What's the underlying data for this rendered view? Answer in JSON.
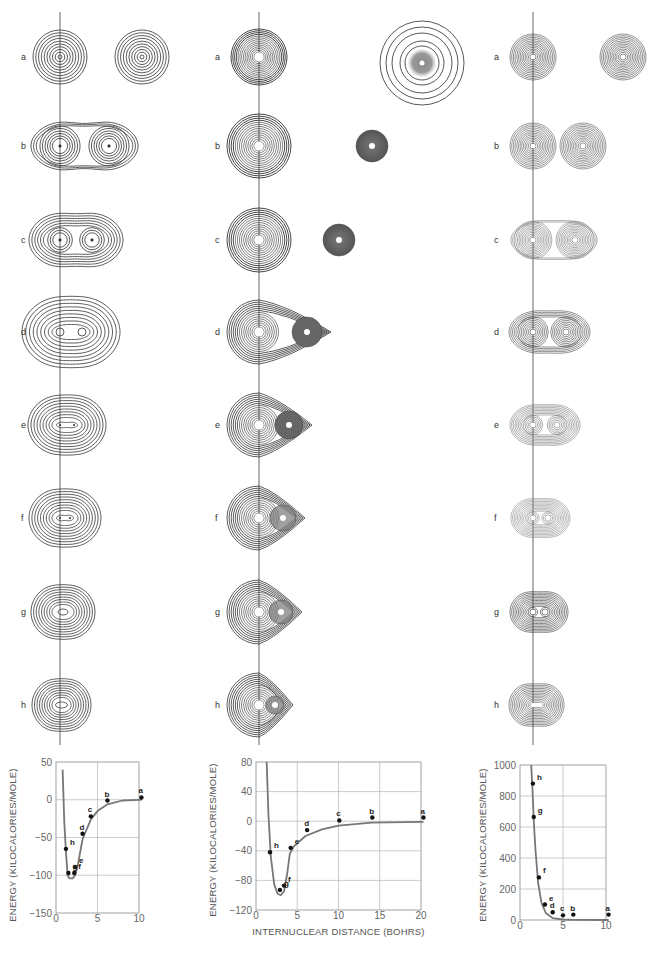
{
  "figure": {
    "row_labels": [
      "a",
      "b",
      "c",
      "d",
      "e",
      "f",
      "g",
      "h"
    ],
    "columns": [
      {
        "id": "left",
        "description": "symmetric diatomic contour maps, atoms approaching and merging"
      },
      {
        "id": "middle",
        "description": "large atom with small dense (shaded) atom approaching"
      },
      {
        "id": "right",
        "description": "two identical dense atoms approaching"
      }
    ]
  },
  "chart_data": [
    {
      "type": "line",
      "title": "",
      "xlabel": "",
      "ylabel": "ENERGY (KILOCALORIES/MOLE)",
      "xlim": [
        0,
        10
      ],
      "ylim": [
        -150,
        50
      ],
      "xticks": [
        "0",
        "5",
        "10"
      ],
      "yticks": [
        "50",
        "0",
        "-50",
        "-100",
        "-150"
      ],
      "grid": true,
      "series": [
        {
          "name": "computed (black points)",
          "points": [
            {
              "label": "a",
              "x": 10.3,
              "y": 3
            },
            {
              "label": "b",
              "x": 6.2,
              "y": -1
            },
            {
              "label": "c",
              "x": 4.2,
              "y": -22
            },
            {
              "label": "d",
              "x": 3.2,
              "y": -45
            },
            {
              "label": "e",
              "x": 2.3,
              "y": -89
            },
            {
              "label": "f",
              "x": 2.2,
              "y": -97
            },
            {
              "label": "g",
              "x": 1.5,
              "y": -97
            },
            {
              "label": "h",
              "x": 1.2,
              "y": -65
            }
          ]
        },
        {
          "name": "curve (gray)",
          "points": [
            {
              "x": 0.8,
              "y": 40
            },
            {
              "x": 1.0,
              "y": -30
            },
            {
              "x": 1.2,
              "y": -70
            },
            {
              "x": 1.4,
              "y": -100
            },
            {
              "x": 1.6,
              "y": -104
            },
            {
              "x": 2.0,
              "y": -104
            },
            {
              "x": 2.3,
              "y": -100
            },
            {
              "x": 2.6,
              "y": -88
            },
            {
              "x": 3.2,
              "y": -52
            },
            {
              "x": 4.2,
              "y": -26
            },
            {
              "x": 5.0,
              "y": -15
            },
            {
              "x": 6.2,
              "y": -6
            },
            {
              "x": 8.0,
              "y": -1
            },
            {
              "x": 10.0,
              "y": 0
            },
            {
              "x": 10.3,
              "y": 0
            }
          ]
        }
      ]
    },
    {
      "type": "line",
      "title": "",
      "xlabel": "INTERNUCLEAR DISTANCE (BOHRS)",
      "ylabel": "ENERGY (KILOCALORIES/MOLE)",
      "xlim": [
        0,
        20
      ],
      "ylim": [
        -120,
        80
      ],
      "xticks": [
        "0",
        "5",
        "10",
        "15",
        "20"
      ],
      "yticks": [
        "80",
        "40",
        "0",
        "-40",
        "-80",
        "-120"
      ],
      "grid": true,
      "series": [
        {
          "name": "computed (black points)",
          "points": [
            {
              "label": "a",
              "x": 20.3,
              "y": 5
            },
            {
              "label": "b",
              "x": 14.1,
              "y": 5
            },
            {
              "label": "c",
              "x": 10.1,
              "y": 1
            },
            {
              "label": "d",
              "x": 6.2,
              "y": -12
            },
            {
              "label": "e",
              "x": 4.2,
              "y": -36
            },
            {
              "label": "f",
              "x": 3.4,
              "y": -87
            },
            {
              "label": "g",
              "x": 2.9,
              "y": -93
            },
            {
              "label": "h",
              "x": 1.7,
              "y": -42
            }
          ]
        },
        {
          "name": "curve (gray)",
          "points": [
            {
              "x": 1.3,
              "y": 80
            },
            {
              "x": 1.5,
              "y": 10
            },
            {
              "x": 1.8,
              "y": -48
            },
            {
              "x": 2.2,
              "y": -85
            },
            {
              "x": 2.6,
              "y": -98
            },
            {
              "x": 3.0,
              "y": -100
            },
            {
              "x": 3.4,
              "y": -95
            },
            {
              "x": 3.8,
              "y": -70
            },
            {
              "x": 4.1,
              "y": -44
            },
            {
              "x": 4.6,
              "y": -34
            },
            {
              "x": 6.0,
              "y": -20
            },
            {
              "x": 8.0,
              "y": -11
            },
            {
              "x": 10.0,
              "y": -6
            },
            {
              "x": 14.0,
              "y": -2
            },
            {
              "x": 20.3,
              "y": -1
            }
          ]
        }
      ]
    },
    {
      "type": "line",
      "title": "",
      "xlabel": "",
      "ylabel": "ENERGY (KILOCALORIES/MOLE)",
      "xlim": [
        0,
        10
      ],
      "ylim": [
        0,
        1000
      ],
      "xticks": [
        "0",
        "5",
        "10"
      ],
      "yticks": [
        "1000",
        "800",
        "600",
        "400",
        "200",
        "0"
      ],
      "grid": true,
      "series": [
        {
          "name": "computed (black points)",
          "points": [
            {
              "label": "a",
              "x": 10.3,
              "y": 35
            },
            {
              "label": "b",
              "x": 6.2,
              "y": 35
            },
            {
              "label": "c",
              "x": 5.0,
              "y": 30
            },
            {
              "label": "d",
              "x": 3.8,
              "y": 50
            },
            {
              "label": "e",
              "x": 2.9,
              "y": 100
            },
            {
              "label": "f",
              "x": 2.2,
              "y": 275
            },
            {
              "label": "g",
              "x": 1.6,
              "y": 665
            },
            {
              "label": "h",
              "x": 1.5,
              "y": 880
            }
          ]
        },
        {
          "name": "curve (gray)",
          "points": [
            {
              "x": 1.3,
              "y": 1000
            },
            {
              "x": 1.45,
              "y": 840
            },
            {
              "x": 1.6,
              "y": 635
            },
            {
              "x": 1.8,
              "y": 450
            },
            {
              "x": 2.1,
              "y": 240
            },
            {
              "x": 2.5,
              "y": 110
            },
            {
              "x": 3.0,
              "y": 45
            },
            {
              "x": 3.8,
              "y": 12
            },
            {
              "x": 5.0,
              "y": 3
            },
            {
              "x": 6.2,
              "y": 1
            },
            {
              "x": 10.3,
              "y": 0
            }
          ]
        }
      ]
    }
  ]
}
